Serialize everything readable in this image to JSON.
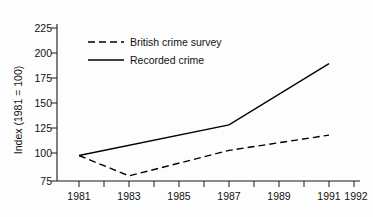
{
  "chart_data": {
    "type": "line",
    "title": "",
    "xlabel": "",
    "ylabel": "Index (1981 = 100)",
    "xlim": [
      1981,
      1992
    ],
    "ylim": [
      75,
      225
    ],
    "grid": false,
    "legend_position": "upper-left-inside",
    "x_tick_labels": [
      "1981",
      "1983",
      "1985",
      "1987",
      "1989",
      "1991",
      "1992"
    ],
    "x_tick_values": [
      1981,
      1983,
      1985,
      1987,
      1989,
      1991,
      1992
    ],
    "x_minor_ticks": [
      1981,
      1982,
      1983,
      1984,
      1985,
      1986,
      1987,
      1988,
      1989,
      1990,
      1991,
      1992
    ],
    "y_tick_labels": [
      "75",
      "100",
      "125",
      "150",
      "175",
      "200",
      "225"
    ],
    "y_tick_values": [
      75,
      100,
      125,
      150,
      175,
      200,
      225
    ],
    "series": [
      {
        "name": "British crime survey",
        "style": "dashed",
        "color": "#000000",
        "x": [
          1981,
          1983,
          1987,
          1991
        ],
        "values": [
          100,
          80,
          105,
          120
        ]
      },
      {
        "name": "Recorded crime",
        "style": "solid",
        "color": "#000000",
        "x": [
          1981,
          1987,
          1991
        ],
        "values": [
          100,
          130,
          190
        ]
      }
    ]
  },
  "axes": {
    "y_axis_title": "Index (1981 = 100)"
  },
  "legend": {
    "entries": [
      {
        "label": "British crime survey",
        "style": "dashed"
      },
      {
        "label": "Recorded crime",
        "style": "solid"
      }
    ]
  },
  "ticks": {
    "y": [
      {
        "label": "225"
      },
      {
        "label": "200"
      },
      {
        "label": "175"
      },
      {
        "label": "150"
      },
      {
        "label": "125"
      },
      {
        "label": "100"
      },
      {
        "label": "75"
      }
    ],
    "x": [
      {
        "label": "1981"
      },
      {
        "label": "1983"
      },
      {
        "label": "1985"
      },
      {
        "label": "1987"
      },
      {
        "label": "1989"
      },
      {
        "label": "1991"
      },
      {
        "label": "1992"
      }
    ]
  }
}
